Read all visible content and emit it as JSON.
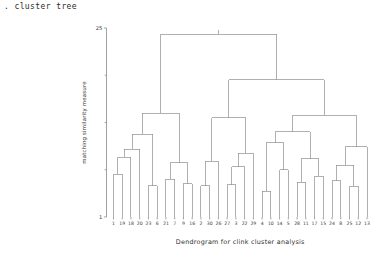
{
  "console": {
    "title": ". cluster tree"
  },
  "chart_data": {
    "type": "dendrogram",
    "title": "",
    "xlabel": "Dendrogram for clink cluster analysis",
    "ylabel": "matching similarity measure",
    "ylim": [
      1,
      25
    ],
    "ytick_values": [
      1,
      25
    ],
    "ytick_labels": [
      "1",
      "25"
    ],
    "grid": false,
    "legend": null,
    "leaf_order": [
      1,
      19,
      18,
      20,
      23,
      6,
      21,
      7,
      9,
      16,
      2,
      30,
      26,
      27,
      3,
      22,
      29,
      4,
      10,
      14,
      5,
      28,
      11,
      17,
      15,
      24,
      8,
      25,
      12,
      13
    ],
    "leaf_labels": [
      "1",
      "19",
      "18",
      "20",
      "23",
      "6",
      "21",
      "7",
      "9",
      "16",
      "2",
      "30",
      "26",
      "27",
      "3",
      "22",
      "29",
      "4",
      "10",
      "14",
      "5",
      "28",
      "11",
      "17",
      "15",
      "24",
      "8",
      "25",
      "12",
      "13"
    ],
    "leaf_heights": [
      1.0,
      1.0,
      1.0,
      1.0,
      1.0,
      1.0,
      1.0,
      1.0,
      1.0,
      1.0,
      1.0,
      1.0,
      1.0,
      1.0,
      1.0,
      1.0,
      1.0,
      1.0,
      1.0,
      1.0,
      1.0,
      1.0,
      1.0,
      1.0,
      1.0,
      1.0,
      1.0,
      1.0,
      1.0,
      1.0
    ],
    "merges": [
      {
        "id": "m1",
        "left": "leaf:0",
        "right": "leaf:1",
        "height": 6.4
      },
      {
        "id": "m2",
        "left": "m1",
        "right": "leaf:2",
        "height": 8.6
      },
      {
        "id": "m3",
        "left": "m2",
        "right": "leaf:3",
        "height": 9.6
      },
      {
        "id": "m4",
        "left": "leaf:4",
        "right": "leaf:5",
        "height": 5.0
      },
      {
        "id": "m5",
        "left": "m3",
        "right": "m4",
        "height": 11.5
      },
      {
        "id": "m6",
        "left": "leaf:6",
        "right": "leaf:7",
        "height": 5.8
      },
      {
        "id": "m7",
        "left": "leaf:8",
        "right": "leaf:9",
        "height": 5.2
      },
      {
        "id": "m8",
        "left": "m6",
        "right": "m7",
        "height": 7.9
      },
      {
        "id": "m9",
        "left": "m5",
        "right": "m8",
        "height": 14.2
      },
      {
        "id": "m10",
        "left": "leaf:10",
        "right": "leaf:11",
        "height": 5.0
      },
      {
        "id": "m11",
        "left": "m10",
        "right": "leaf:12",
        "height": 8.1
      },
      {
        "id": "m12",
        "left": "leaf:13",
        "right": "leaf:14",
        "height": 5.1
      },
      {
        "id": "m13",
        "left": "m12",
        "right": "leaf:15",
        "height": 7.4
      },
      {
        "id": "m14",
        "left": "m13",
        "right": "leaf:16",
        "height": 9.1
      },
      {
        "id": "m15",
        "left": "m11",
        "right": "m14",
        "height": 13.6
      },
      {
        "id": "m16",
        "left": "leaf:17",
        "right": "leaf:18",
        "height": 4.3
      },
      {
        "id": "m17",
        "left": "leaf:19",
        "right": "leaf:20",
        "height": 7.0
      },
      {
        "id": "m18",
        "left": "m16",
        "right": "m17",
        "height": 10.4
      },
      {
        "id": "m19",
        "left": "leaf:21",
        "right": "leaf:22",
        "height": 5.4
      },
      {
        "id": "m20",
        "left": "leaf:23",
        "right": "leaf:24",
        "height": 6.2
      },
      {
        "id": "m21",
        "left": "m19",
        "right": "m20",
        "height": 8.4
      },
      {
        "id": "m22",
        "left": "m18",
        "right": "m21",
        "height": 11.8
      },
      {
        "id": "m23",
        "left": "leaf:25",
        "right": "leaf:26",
        "height": 5.6
      },
      {
        "id": "m24",
        "left": "leaf:27",
        "right": "leaf:28",
        "height": 4.9
      },
      {
        "id": "m25",
        "left": "m23",
        "right": "m24",
        "height": 7.6
      },
      {
        "id": "m26",
        "left": "m25",
        "right": "leaf:29",
        "height": 9.9
      },
      {
        "id": "m27",
        "left": "m22",
        "right": "m26",
        "height": 13.9
      },
      {
        "id": "m28",
        "left": "m15",
        "right": "m27",
        "height": 18.4
      },
      {
        "id": "m29",
        "left": "m9",
        "right": "m28",
        "height": 24.2
      }
    ]
  }
}
